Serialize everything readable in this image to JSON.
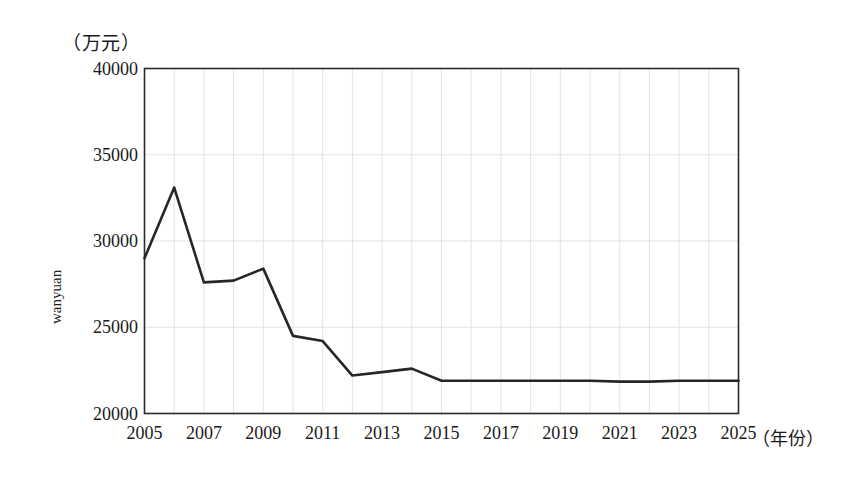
{
  "chart_data": {
    "type": "line",
    "title": "",
    "unit_note": "（万元）",
    "xlabel": "（年份）",
    "ylabel": "wanyuan",
    "x": [
      2005,
      2006,
      2007,
      2008,
      2009,
      2010,
      2011,
      2012,
      2013,
      2014,
      2015,
      2016,
      2017,
      2018,
      2019,
      2020,
      2021,
      2022,
      2023,
      2024,
      2025
    ],
    "values": [
      29000,
      33100,
      27600,
      27700,
      28400,
      24500,
      24200,
      22200,
      22400,
      22600,
      21900,
      21900,
      21900,
      21900,
      21900,
      21900,
      21850,
      21850,
      21900,
      21900,
      21900
    ],
    "categories": [
      "2005",
      "2006",
      "2007",
      "2008",
      "2009",
      "2010",
      "2011",
      "2012",
      "2013",
      "2014",
      "2015",
      "2016",
      "2017",
      "2018",
      "2019",
      "2020",
      "2021",
      "2022",
      "2023",
      "2024",
      "2025"
    ],
    "xlim": [
      2005,
      2025
    ],
    "ylim": [
      20000,
      40000
    ],
    "yticks": [
      20000,
      25000,
      30000,
      35000,
      40000
    ],
    "ytick_labels": [
      "20000",
      "25000",
      "30000",
      "35000",
      "40000"
    ],
    "xticks": [
      2005,
      2007,
      2009,
      2011,
      2013,
      2015,
      2017,
      2019,
      2021,
      2023,
      2025
    ],
    "xtick_labels": [
      "2005",
      "2007",
      "2009",
      "2011",
      "2013",
      "2015",
      "2017",
      "2019",
      "2021",
      "2023",
      "2025"
    ],
    "grid": true,
    "legend": "none",
    "series_color": "#262626",
    "grid_color": "#e3e3e3",
    "axis_color": "#2b2b2b",
    "background": "#ffffff"
  }
}
